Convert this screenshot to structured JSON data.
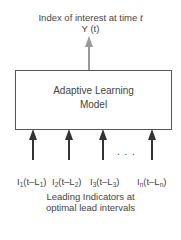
{
  "output": {
    "title_prefix": "Index of interest at time ",
    "title_var": "t",
    "label": "Y (t)",
    "arrow_color": "#999999"
  },
  "model": {
    "line1": "Adaptive Learning",
    "line2": "Model"
  },
  "inputs": {
    "arrow_color": "#333333",
    "ellipsis": ". . .",
    "items": [
      {
        "name": "I",
        "sub": "1",
        "mid": "(t–L",
        "sub2": "1",
        "end": ")"
      },
      {
        "name": "I",
        "sub": "2",
        "mid": "(t–L",
        "sub2": "2",
        "end": ")"
      },
      {
        "name": "I",
        "sub": "3",
        "mid": "(t–L",
        "sub2": "3",
        "end": ")"
      },
      {
        "name": "I",
        "sub": "n",
        "mid": "(t–L",
        "sub2": "n",
        "end": ")"
      }
    ],
    "caption_line1": "Leading Indicators at",
    "caption_line2": "optimal lead intervals"
  }
}
